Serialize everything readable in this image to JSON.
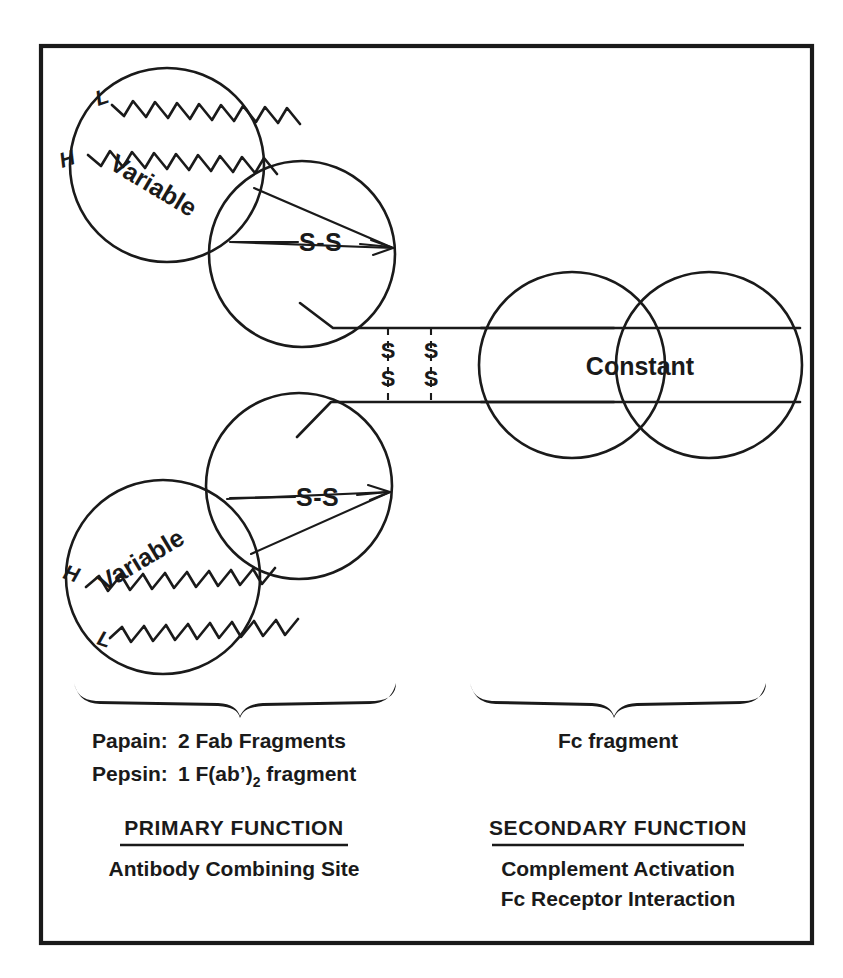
{
  "figure": {
    "ink_color": "#1a1a1a",
    "background_color": "#ffffff"
  },
  "diagram": {
    "upper_fab": {
      "variable_label": "Variable",
      "heavy_chain_label": "H",
      "light_chain_label": "L",
      "disulfide_label": "S-S"
    },
    "lower_fab": {
      "variable_label": "Variable",
      "heavy_chain_label": "H",
      "light_chain_label": "L",
      "disulfide_label": "S-S"
    },
    "fc": {
      "constant_label": "Constant"
    },
    "hinge": {
      "bond_1_top": "S",
      "bond_1_bottom": "S",
      "bond_2_top": "S",
      "bond_2_bottom": "S"
    }
  },
  "left_column": {
    "enzyme_rows": [
      {
        "enzyme": "Papain:",
        "product": "2 Fab Fragments"
      },
      {
        "enzyme": "Pepsin:",
        "product_prefix": "1 F(ab’)",
        "product_subscript": "2",
        "product_suffix": " fragment"
      }
    ],
    "function_heading": "PRIMARY FUNCTION",
    "function_items": [
      "Antibody Combining Site"
    ]
  },
  "right_column": {
    "fragment_label": "Fc fragment",
    "function_heading": "SECONDARY FUNCTION",
    "function_items": [
      "Complement Activation",
      "Fc Receptor Interaction"
    ]
  }
}
